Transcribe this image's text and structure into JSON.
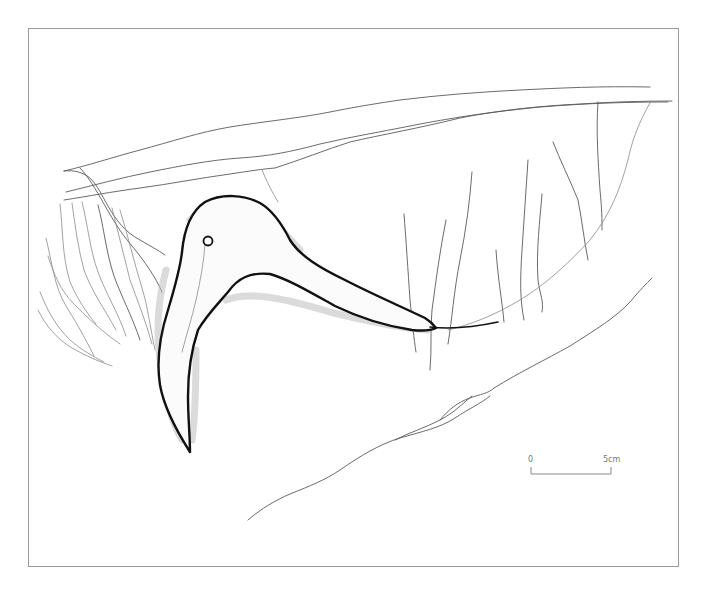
{
  "figure": {
    "colors": {
      "frame": "#9a9a9a",
      "outline": "#111111",
      "cracks": "#5a5a5a",
      "shading": "#bdbdbd",
      "background": "#ffffff"
    }
  },
  "scale_bar": {
    "start_label": "0",
    "end_label": "5cm"
  }
}
